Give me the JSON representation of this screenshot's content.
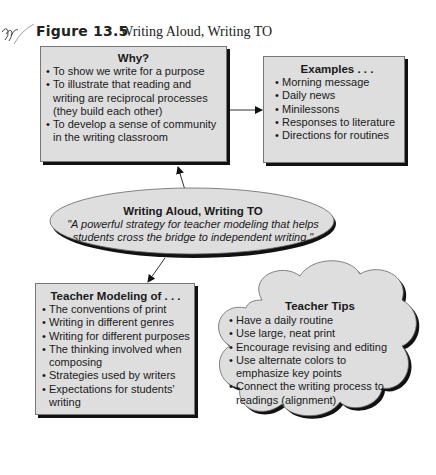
{
  "header": {
    "figure_number": "Figure 13.5",
    "figure_title": "Writing Aloud, Writing TO"
  },
  "why_box": {
    "title": "Why?",
    "items": [
      "To show we write for a purpose",
      "To illustrate that reading and writing are reciprocal processes (they build each other)",
      "To develop a sense of community in the writing classroom"
    ]
  },
  "examples_box": {
    "title": "Examples . . .",
    "items": [
      "Morning message",
      "Daily news",
      "Minilessons",
      "Responses to literature",
      "Directions for routines"
    ]
  },
  "center_ellipse": {
    "title": "Writing Aloud, Writing TO",
    "quote_line1": "\"A powerful strategy for teacher modeling that helps",
    "quote_line2": "students cross the bridge to independent writing.\""
  },
  "modeling_box": {
    "title": "Teacher Modeling of . . .",
    "items": [
      "The conventions of print",
      "Writing in different genres",
      "Writing for different purposes",
      "The thinking involved when composing",
      "Strategies used by writers",
      "Expectations for students' writing"
    ]
  },
  "tips_cloud": {
    "title": "Teacher Tips",
    "items": [
      "Have a daily routine",
      "Use large, neat print",
      "Encourage revising and editing",
      "Use alternate colors to emphasize key points",
      "Connect the writing process to readings (alignment)"
    ]
  },
  "colors": {
    "box_fill": "#dedede",
    "shadow": "#111111",
    "text": "#1a1a1a"
  }
}
